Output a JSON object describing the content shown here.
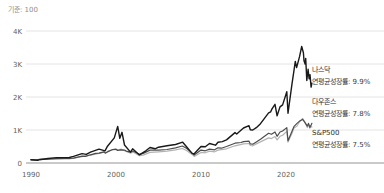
{
  "header": {
    "baseline_note": "기준: 100"
  },
  "colors": {
    "grid": "#e4e4e4",
    "axis_baseline": "#c9c9c9",
    "tick_text": "#5f5f5f",
    "note_text": "#8f8f8f"
  },
  "chart_data": {
    "type": "line",
    "title": "",
    "subtitle_note": "기준: 100",
    "xlabel": "",
    "ylabel": "",
    "legend_position": "right-margin-annotations",
    "grid": "horizontal-only",
    "x_axis": {
      "ticks": [
        1990,
        2000,
        2010,
        2020
      ],
      "range": [
        1990,
        2023.3
      ]
    },
    "y_axis": {
      "range": [
        0,
        4300
      ],
      "ticks": [
        {
          "value": 4000,
          "label": "4K"
        },
        {
          "value": 3000,
          "label": "3K"
        },
        {
          "value": 2000,
          "label": "2K"
        },
        {
          "value": 1000,
          "label": "1K"
        },
        {
          "value": 0,
          "label": "0"
        }
      ]
    },
    "series": [
      {
        "id": "nasdaq",
        "name": "나스닥",
        "rate_label": "연평균성장률: 9.9%",
        "color": "#191919",
        "points": [
          [
            1990,
            100
          ],
          [
            1990.8,
            82
          ],
          [
            1991,
            100
          ],
          [
            1992,
            135
          ],
          [
            1993,
            165
          ],
          [
            1994.5,
            168
          ],
          [
            1995,
            200
          ],
          [
            1996,
            285
          ],
          [
            1996.5,
            260
          ],
          [
            1997,
            330
          ],
          [
            1998,
            420
          ],
          [
            1998.7,
            370
          ],
          [
            1999,
            510
          ],
          [
            1999.8,
            760
          ],
          [
            2000.2,
            1110
          ],
          [
            2000.45,
            750
          ],
          [
            2000.7,
            930
          ],
          [
            2001,
            545
          ],
          [
            2001.7,
            330
          ],
          [
            2001.95,
            430
          ],
          [
            2002.75,
            245
          ],
          [
            2003.5,
            370
          ],
          [
            2004,
            470
          ],
          [
            2004.6,
            430
          ],
          [
            2005,
            480
          ],
          [
            2006,
            520
          ],
          [
            2007,
            560
          ],
          [
            2007.85,
            630
          ],
          [
            2008.2,
            520
          ],
          [
            2008.95,
            290
          ],
          [
            2009.2,
            280
          ],
          [
            2010,
            500
          ],
          [
            2010.5,
            490
          ],
          [
            2011,
            590
          ],
          [
            2011.7,
            540
          ],
          [
            2012,
            630
          ],
          [
            2012.5,
            650
          ],
          [
            2013,
            700
          ],
          [
            2014,
            920
          ],
          [
            2014.2,
            880
          ],
          [
            2015,
            1060
          ],
          [
            2015.65,
            1130
          ],
          [
            2015.8,
            1010
          ],
          [
            2016.1,
            1000
          ],
          [
            2016.5,
            1070
          ],
          [
            2017,
            1190
          ],
          [
            2017.95,
            1520
          ],
          [
            2018.2,
            1550
          ],
          [
            2018.35,
            1640
          ],
          [
            2018.7,
            1780
          ],
          [
            2018.95,
            1430
          ],
          [
            2019.3,
            1700
          ],
          [
            2019.6,
            1760
          ],
          [
            2020.1,
            2160
          ],
          [
            2020.23,
            1510
          ],
          [
            2020.7,
            2400
          ],
          [
            2020.95,
            2830
          ],
          [
            2021.1,
            3080
          ],
          [
            2021.25,
            2890
          ],
          [
            2021.6,
            3230
          ],
          [
            2021.85,
            3530
          ],
          [
            2022.05,
            3340
          ],
          [
            2022.12,
            3100
          ],
          [
            2022.25,
            3000
          ],
          [
            2022.32,
            3170
          ],
          [
            2022.45,
            2500
          ],
          [
            2022.6,
            2840
          ],
          [
            2022.72,
            2550
          ],
          [
            2022.82,
            2680
          ],
          [
            2022.95,
            2300
          ],
          [
            2023.05,
            2420
          ]
        ]
      },
      {
        "id": "dow-jones",
        "name": "다우존스",
        "rate_label": "연평균성장률: 7.8%",
        "color": "#4d4d4d",
        "points": [
          [
            1990,
            100
          ],
          [
            1990.6,
            92
          ],
          [
            1991,
            110
          ],
          [
            1992,
            118
          ],
          [
            1993,
            130
          ],
          [
            1994,
            139
          ],
          [
            1994.5,
            135
          ],
          [
            1995,
            150
          ],
          [
            1996,
            210
          ],
          [
            1996.4,
            200
          ],
          [
            1997,
            250
          ],
          [
            1997.6,
            290
          ],
          [
            1998,
            300
          ],
          [
            1998.6,
            340
          ],
          [
            1998.75,
            300
          ],
          [
            1999,
            335
          ],
          [
            1999.6,
            410
          ],
          [
            2000,
            418
          ],
          [
            2000.2,
            380
          ],
          [
            2000.5,
            400
          ],
          [
            2001,
            390
          ],
          [
            2001.2,
            360
          ],
          [
            2001.7,
            330
          ],
          [
            2002,
            365
          ],
          [
            2002.75,
            265
          ],
          [
            2003.2,
            290
          ],
          [
            2004,
            390
          ],
          [
            2005,
            390
          ],
          [
            2006,
            410
          ],
          [
            2007,
            460
          ],
          [
            2007.8,
            514
          ],
          [
            2008.3,
            450
          ],
          [
            2008.95,
            300
          ],
          [
            2009.2,
            240
          ],
          [
            2010,
            390
          ],
          [
            2010.5,
            370
          ],
          [
            2011,
            420
          ],
          [
            2011.6,
            400
          ],
          [
            2012,
            460
          ],
          [
            2012.4,
            450
          ],
          [
            2013,
            500
          ],
          [
            2014,
            600
          ],
          [
            2014.7,
            620
          ],
          [
            2015,
            650
          ],
          [
            2015.65,
            660
          ],
          [
            2015.8,
            580
          ],
          [
            2016.1,
            570
          ],
          [
            2016.5,
            640
          ],
          [
            2017,
            720
          ],
          [
            2017.95,
            900
          ],
          [
            2018.3,
            870
          ],
          [
            2018.7,
            940
          ],
          [
            2018.95,
            810
          ],
          [
            2019.3,
            940
          ],
          [
            2019.6,
            970
          ],
          [
            2020.1,
            1073
          ],
          [
            2020.23,
            675
          ],
          [
            2020.7,
            960
          ],
          [
            2020.95,
            1112
          ],
          [
            2021.3,
            1200
          ],
          [
            2021.6,
            1270
          ],
          [
            2021.95,
            1320
          ],
          [
            2022.2,
            1240
          ],
          [
            2022.5,
            1118
          ],
          [
            2022.65,
            1200
          ],
          [
            2022.8,
            1080
          ],
          [
            2022.95,
            1150
          ],
          [
            2023.05,
            1204
          ]
        ]
      },
      {
        "id": "sp500",
        "name": "S&P500",
        "rate_label": "연평균성장률: 7.5%",
        "color": "#b3b3b3",
        "points": [
          [
            1990,
            100
          ],
          [
            1990.6,
            90
          ],
          [
            1991,
            108
          ],
          [
            1992,
            120
          ],
          [
            1993,
            128
          ],
          [
            1994,
            132
          ],
          [
            1994.5,
            128
          ],
          [
            1995,
            145
          ],
          [
            1996,
            195
          ],
          [
            1997,
            240
          ],
          [
            1997.6,
            270
          ],
          [
            1998,
            290
          ],
          [
            1998.6,
            330
          ],
          [
            1998.75,
            290
          ],
          [
            1999,
            350
          ],
          [
            1999.6,
            400
          ],
          [
            2000,
            416
          ],
          [
            2000.3,
            400
          ],
          [
            2000.6,
            420
          ],
          [
            2001,
            370
          ],
          [
            2001.7,
            300
          ],
          [
            2002,
            330
          ],
          [
            2002.75,
            220
          ],
          [
            2003.2,
            240
          ],
          [
            2004,
            320
          ],
          [
            2005,
            340
          ],
          [
            2006,
            360
          ],
          [
            2007,
            400
          ],
          [
            2007.8,
            440
          ],
          [
            2008.3,
            380
          ],
          [
            2008.95,
            260
          ],
          [
            2009.2,
            200
          ],
          [
            2010,
            320
          ],
          [
            2010.5,
            310
          ],
          [
            2011,
            360
          ],
          [
            2011.6,
            340
          ],
          [
            2012,
            390
          ],
          [
            2013,
            430
          ],
          [
            2014,
            520
          ],
          [
            2015,
            580
          ],
          [
            2015.65,
            590
          ],
          [
            2015.8,
            530
          ],
          [
            2016.1,
            520
          ],
          [
            2016.5,
            580
          ],
          [
            2017,
            640
          ],
          [
            2017.95,
            760
          ],
          [
            2018.3,
            740
          ],
          [
            2018.7,
            800
          ],
          [
            2018.95,
            700
          ],
          [
            2019.3,
            810
          ],
          [
            2019.6,
            840
          ],
          [
            2020.1,
            959
          ],
          [
            2020.23,
            634
          ],
          [
            2020.7,
            900
          ],
          [
            2020.95,
            1064
          ],
          [
            2021.3,
            1120
          ],
          [
            2021.6,
            1250
          ],
          [
            2021.95,
            1350
          ],
          [
            2022.2,
            1250
          ],
          [
            2022.5,
            1072
          ],
          [
            2022.65,
            1180
          ],
          [
            2022.8,
            1050
          ],
          [
            2022.95,
            1120
          ],
          [
            2023.05,
            1088
          ]
        ]
      }
    ]
  }
}
